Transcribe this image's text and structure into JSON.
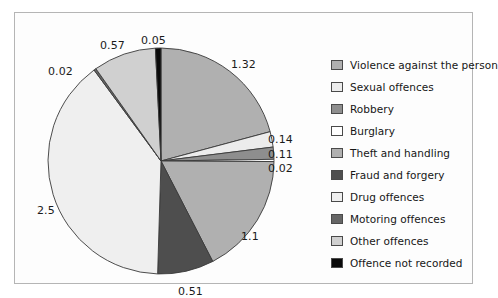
{
  "chart_data": {
    "type": "pie",
    "title": "",
    "subtitle": "",
    "xlabel": "",
    "ylabel": "",
    "grid": false,
    "legend_position": "right",
    "start_angle_deg": 0,
    "direction": "clockwise",
    "total": 6.34,
    "categories": [
      "Violence against the person",
      "Sexual offences",
      "Robbery",
      "Burglary",
      "Theft and handling",
      "Fraud and forgery",
      "Drug offences",
      "Motoring offences",
      "Other offences",
      "Offence not recorded"
    ],
    "values": [
      1.32,
      0.14,
      0.11,
      0.02,
      1.1,
      0.51,
      2.5,
      0.02,
      0.57,
      0.05
    ],
    "data_labels": [
      "1.32",
      "0.14",
      "0.11",
      "0.02",
      "1.1",
      "0.51",
      "2.5",
      "0.02",
      "0.57",
      "0.05"
    ],
    "colors": [
      "#b0b0b0",
      "#ececec",
      "#8e8e8e",
      "#ffffff",
      "#b0b0b0",
      "#4e4e4e",
      "#efefef",
      "#666666",
      "#d0d0d0",
      "#0a0a0a"
    ]
  },
  "legend": {
    "items": [
      {
        "label": "Violence against the person",
        "color": "#b0b0b0",
        "swatch_name": "legend-swatch-violence"
      },
      {
        "label": "Sexual offences",
        "color": "#ececec",
        "swatch_name": "legend-swatch-sexual"
      },
      {
        "label": "Robbery",
        "color": "#8e8e8e",
        "swatch_name": "legend-swatch-robbery"
      },
      {
        "label": "Burglary",
        "color": "#ffffff",
        "swatch_name": "legend-swatch-burglary"
      },
      {
        "label": "Theft and handling",
        "color": "#b0b0b0",
        "swatch_name": "legend-swatch-theft"
      },
      {
        "label": "Fraud and forgery",
        "color": "#4e4e4e",
        "swatch_name": "legend-swatch-fraud"
      },
      {
        "label": "Drug offences",
        "color": "#efefef",
        "swatch_name": "legend-swatch-drug"
      },
      {
        "label": "Motoring offences",
        "color": "#666666",
        "swatch_name": "legend-swatch-motoring"
      },
      {
        "label": "Other offences",
        "color": "#d0d0d0",
        "swatch_name": "legend-swatch-other"
      },
      {
        "label": "Offence not recorded",
        "color": "#0a0a0a",
        "swatch_name": "legend-swatch-not-recorded"
      }
    ]
  },
  "slice_labels": [
    {
      "text": "0.05",
      "left": 126,
      "top": 22
    },
    {
      "text": "1.32",
      "left": 216,
      "top": 46
    },
    {
      "text": "0.14",
      "left": 253,
      "top": 121
    },
    {
      "text": "0.11",
      "left": 253,
      "top": 136
    },
    {
      "text": "0.02",
      "left": 253,
      "top": 150
    },
    {
      "text": "1.1",
      "left": 226,
      "top": 218
    },
    {
      "text": "0.51",
      "left": 163,
      "top": 273
    },
    {
      "text": "2.5",
      "left": 22,
      "top": 192
    },
    {
      "text": "0.02",
      "left": 33,
      "top": 53
    },
    {
      "text": "0.57",
      "left": 85,
      "top": 27
    }
  ],
  "frame": {
    "border_color": "#b5b5b5",
    "background": "#fdfdfd"
  }
}
